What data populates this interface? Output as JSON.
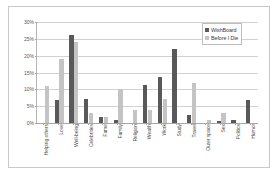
{
  "chart_data": {
    "type": "bar",
    "title": "",
    "subtitle": "",
    "xlabel": "",
    "ylabel": "",
    "ylim": [
      0,
      30
    ],
    "ytick_labels": [
      "30%",
      "25%",
      "20%",
      "15%",
      "10%",
      "5%",
      "0%"
    ],
    "ytick_values": [
      30,
      25,
      20,
      15,
      10,
      5,
      0
    ],
    "grid": true,
    "legend_position": "top-right",
    "categories": [
      "Helping others",
      "Love",
      "Well-being",
      "Celebrities",
      "Fame",
      "Family",
      "Religion",
      "Wealth",
      "Work",
      "Study",
      "Travel",
      "Outer space",
      "Sex",
      "Politics",
      "Humor"
    ],
    "series": [
      {
        "name": "WishBoard",
        "color": "#595959",
        "values": [
          0,
          6.7,
          26.0,
          7.2,
          1.7,
          0.8,
          0,
          11.3,
          13.7,
          22.0,
          2.4,
          0,
          0.5,
          1.0,
          6.8
        ]
      },
      {
        "name": "Before I Die",
        "color": "#c4c4c4",
        "values": [
          11.0,
          19.0,
          24.0,
          3.0,
          1.8,
          10.0,
          4.0,
          4.0,
          7.2,
          0,
          12.0,
          1.0,
          3.0,
          0,
          0
        ]
      }
    ]
  },
  "colors": {
    "series_wishboard": "#595959",
    "series_before_i_die": "#c4c4c4",
    "gridline": "#d2d2d2",
    "axis": "#a8a8a8",
    "frame_border": "#c9c9c9",
    "background": "#ffffff",
    "tick_text": "#5c5c5c"
  }
}
